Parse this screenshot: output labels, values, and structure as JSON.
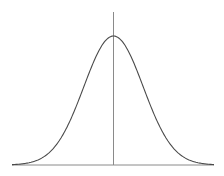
{
  "chart_data": {
    "type": "line",
    "title": "",
    "xlabel": "",
    "ylabel": "",
    "distribution": {
      "mean": 0,
      "std": 1
    },
    "xlim": [
      -3.4,
      3.4
    ],
    "ylim": [
      0,
      0.4
    ],
    "grid": false,
    "legend": null,
    "series": [
      {
        "name": "normal-pdf",
        "x": [
          -3.4,
          -3,
          -2.5,
          -2,
          -1.5,
          -1,
          -0.5,
          0,
          0.5,
          1,
          1.5,
          2,
          2.5,
          3,
          3.4
        ],
        "values": [
          0.0012,
          0.0044,
          0.0175,
          0.054,
          0.1295,
          0.242,
          0.3521,
          0.3989,
          0.3521,
          0.242,
          0.1295,
          0.054,
          0.0175,
          0.0044,
          0.0012
        ]
      }
    ],
    "colors": {
      "curve": "#4a4a4a",
      "axes": "#8a8a8a"
    }
  },
  "layout": {
    "center_x": 113.5,
    "baseline_y": 165,
    "peak_y": 36,
    "axis_top_y": 12,
    "axis_left_x": 12,
    "axis_right_x": 214,
    "sigma_px": 29.7
  }
}
